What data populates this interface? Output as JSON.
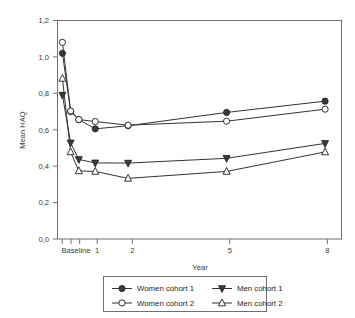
{
  "chart_data": {
    "type": "line",
    "title": "",
    "subtitle": "",
    "xlabel": "Year",
    "ylabel": "Mean HAQ",
    "x_tick_labels": [
      "Baseline",
      "1",
      "2",
      "5",
      "8"
    ],
    "x_tick_positions": [
      0,
      1,
      2,
      5,
      8
    ],
    "x_minor_ticks": [
      0.25,
      0.5
    ],
    "xlim": [
      -0.15,
      8.5
    ],
    "y_tick_labels": [
      "0,0",
      "0,2",
      "0,4",
      "0,6",
      "0,8",
      "1,0",
      "1,2"
    ],
    "y_tick_values": [
      0.0,
      0.2,
      0.4,
      0.6,
      0.8,
      1.0,
      1.2
    ],
    "ylim": [
      0,
      1.2
    ],
    "grid": false,
    "legend_position": "bottom",
    "x": [
      0,
      0.25,
      0.5,
      1,
      2,
      5,
      8
    ],
    "series": [
      {
        "name": "Women cohort 1",
        "marker": "filled-circle",
        "values": [
          1.02,
          0.7,
          0.655,
          0.605,
          0.622,
          0.695,
          0.757
        ]
      },
      {
        "name": "Men cohort 1",
        "marker": "filled-triangle-down",
        "values": [
          0.79,
          0.528,
          0.437,
          0.418,
          0.417,
          0.443,
          0.525
        ]
      },
      {
        "name": "Women cohort 2",
        "marker": "open-circle",
        "values": [
          1.08,
          0.703,
          0.656,
          0.645,
          0.625,
          0.647,
          0.713
        ]
      },
      {
        "name": "Men cohort 2",
        "marker": "open-triangle-up",
        "values": [
          0.882,
          0.478,
          0.374,
          0.371,
          0.333,
          0.371,
          0.478
        ]
      }
    ]
  },
  "axis": {
    "y_title": "Mean HAQ",
    "x_title": "Year",
    "y_labels": {
      "t0": "0,0",
      "t1": "0,2",
      "t2": "0,4",
      "t3": "0,6",
      "t4": "0,8",
      "t5": "1,0",
      "t6": "1,2"
    },
    "x_labels": {
      "t0": "Baseline",
      "t1": "1",
      "t2": "2",
      "t3": "5",
      "t4": "8"
    }
  },
  "legend": {
    "entries": [
      {
        "label": "Women cohort 1",
        "marker": "filled-circle"
      },
      {
        "label": "Men cohort 1",
        "marker": "filled-triangle-down"
      },
      {
        "label": "Women cohort 2",
        "marker": "open-circle"
      },
      {
        "label": "Men cohort 2",
        "marker": "open-triangle-up"
      }
    ]
  },
  "colors": {
    "line": "#333333",
    "marker_fill": "#3a3a3a",
    "marker_edge": "#1d1d1d",
    "axis": "#6f6f6f",
    "text": "#231f20",
    "background": "#ffffff"
  }
}
